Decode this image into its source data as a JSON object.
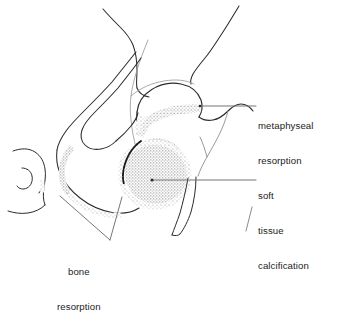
{
  "figure": {
    "kind": "medical-line-drawing",
    "background_color": "#ffffff",
    "ink_color": "#1c1c1c",
    "stipple_color": "#8a8a8a",
    "leader_color": "#6f6f6f"
  },
  "annotations": [
    {
      "id": "metaphyseal",
      "lines": [
        "metaphyseal",
        "resorption"
      ],
      "text": "metaphyseal resorption",
      "leader_from": [
        200,
        106
      ],
      "leader_to": [
        256,
        106
      ]
    },
    {
      "id": "soft-tissue",
      "lines": [
        "soft",
        "tissue",
        "calcification"
      ],
      "text": "soft tissue calcification",
      "leader_from": [
        152,
        180
      ],
      "leader_to": [
        256,
        180
      ]
    },
    {
      "id": "bone",
      "lines": [
        "bone",
        "resorption"
      ],
      "text": "bone resorption",
      "leader_from": [
        60,
        196
      ],
      "leader_to": [
        110,
        240
      ]
    }
  ],
  "labels": {
    "metaphyseal": {
      "line1": "metaphyseal",
      "line2": "resorption"
    },
    "soft_tissue": {
      "line1": "soft",
      "line2": "tissue",
      "line3": "calcification"
    },
    "bone": {
      "line1": "bone",
      "line2": "resorption"
    }
  }
}
